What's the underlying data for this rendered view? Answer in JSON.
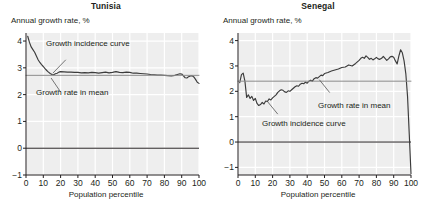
{
  "figure": {
    "background": "#ffffff",
    "panel_background": "#eeeeee",
    "gridline_color": "#ffffff",
    "axis_color": "#231f20",
    "curve_color": "#3b3b3b",
    "mean_line_color": "#8c8c8c"
  },
  "panels": [
    {
      "title": "Tunisia",
      "ylabel": "Annual growth rate, %",
      "xlabel": "Population percentile",
      "annotations": [
        {
          "text": "Growth incidence curve",
          "x": 46,
          "y": 39
        },
        {
          "text": "Growth rate in mean",
          "x": 36,
          "y": 88
        }
      ]
    },
    {
      "title": "Senegal",
      "ylabel": "Annual growth rate, %",
      "xlabel": "Population percentile",
      "annotations": [
        {
          "text": "Growth rate in mean",
          "x": 318,
          "y": 101
        },
        {
          "text": "Growth incidence curve",
          "x": 262,
          "y": 119
        }
      ]
    }
  ],
  "chart_data": [
    {
      "type": "line",
      "title": "Tunisia",
      "xlabel": "Population percentile",
      "ylabel": "Annual growth rate, %",
      "xlim": [
        0,
        100
      ],
      "ylim": [
        -1,
        4.3
      ],
      "xticks": [
        0,
        10,
        20,
        30,
        40,
        50,
        60,
        70,
        80,
        90,
        100
      ],
      "yticks": [
        -1,
        0,
        1,
        2,
        3,
        4
      ],
      "grid": true,
      "legend": "annotations",
      "mean_growth_rate": 2.72,
      "series": [
        {
          "name": "Growth incidence curve",
          "x": [
            1,
            2,
            3,
            4,
            5,
            6,
            7,
            8,
            9,
            10,
            11,
            12,
            13,
            14,
            15,
            16,
            17,
            18,
            19,
            20,
            22,
            24,
            26,
            28,
            30,
            32,
            34,
            36,
            38,
            40,
            42,
            44,
            46,
            48,
            50,
            52,
            54,
            56,
            58,
            60,
            62,
            64,
            66,
            68,
            70,
            72,
            74,
            76,
            78,
            80,
            82,
            84,
            86,
            88,
            89,
            90,
            91,
            92,
            93,
            94,
            95,
            96,
            97,
            98,
            99,
            100
          ],
          "values": [
            4.18,
            3.95,
            3.78,
            3.68,
            3.58,
            3.44,
            3.3,
            3.2,
            3.12,
            3.05,
            2.97,
            2.9,
            2.84,
            2.79,
            2.75,
            2.74,
            2.78,
            2.8,
            2.84,
            2.86,
            2.85,
            2.84,
            2.84,
            2.83,
            2.83,
            2.81,
            2.82,
            2.81,
            2.83,
            2.82,
            2.8,
            2.82,
            2.84,
            2.81,
            2.83,
            2.86,
            2.83,
            2.82,
            2.84,
            2.83,
            2.8,
            2.8,
            2.79,
            2.78,
            2.77,
            2.75,
            2.74,
            2.73,
            2.73,
            2.72,
            2.71,
            2.7,
            2.72,
            2.76,
            2.78,
            2.77,
            2.7,
            2.63,
            2.62,
            2.67,
            2.7,
            2.71,
            2.66,
            2.57,
            2.46,
            2.42
          ]
        },
        {
          "name": "Growth rate in mean",
          "x": [
            0,
            100
          ],
          "values": [
            2.72,
            2.72
          ]
        }
      ]
    },
    {
      "type": "line",
      "title": "Senegal",
      "xlabel": "Population percentile",
      "ylabel": "Annual growth rate, %",
      "xlim": [
        0,
        100
      ],
      "ylim": [
        -1.3,
        4.3
      ],
      "xticks": [
        0,
        10,
        20,
        30,
        40,
        50,
        60,
        70,
        80,
        90,
        100
      ],
      "yticks": [
        -1,
        0,
        1,
        2,
        3,
        4
      ],
      "grid": true,
      "legend": "annotations",
      "mean_growth_rate": 2.4,
      "series": [
        {
          "name": "Growth incidence curve",
          "x": [
            1,
            2,
            3,
            4,
            5,
            6,
            7,
            8,
            9,
            10,
            11,
            12,
            13,
            14,
            15,
            16,
            17,
            18,
            19,
            20,
            21,
            22,
            23,
            24,
            25,
            26,
            27,
            28,
            29,
            30,
            31,
            32,
            33,
            34,
            35,
            36,
            37,
            38,
            39,
            40,
            41,
            42,
            43,
            44,
            45,
            46,
            47,
            48,
            49,
            50,
            52,
            54,
            56,
            58,
            60,
            62,
            64,
            66,
            68,
            70,
            71,
            72,
            73,
            74,
            75,
            76,
            77,
            78,
            79,
            80,
            81,
            82,
            83,
            84,
            85,
            86,
            87,
            88,
            89,
            90,
            91,
            92,
            93,
            94,
            95,
            96,
            97,
            98,
            99,
            100
          ],
          "values": [
            2.34,
            2.66,
            2.72,
            2.4,
            1.76,
            1.86,
            1.72,
            1.8,
            1.64,
            1.72,
            1.52,
            1.44,
            1.48,
            1.56,
            1.5,
            1.62,
            1.6,
            1.7,
            1.66,
            1.74,
            1.8,
            1.86,
            1.96,
            2.02,
            2.06,
            2.04,
            1.98,
            1.96,
            2.02,
            2.0,
            2.06,
            2.12,
            2.18,
            2.22,
            2.2,
            2.28,
            2.32,
            2.3,
            2.36,
            2.32,
            2.4,
            2.44,
            2.4,
            2.5,
            2.54,
            2.52,
            2.58,
            2.64,
            2.62,
            2.7,
            2.74,
            2.8,
            2.84,
            2.88,
            2.94,
            2.96,
            3.04,
            3.0,
            3.1,
            3.22,
            3.3,
            3.34,
            3.3,
            3.4,
            3.34,
            3.26,
            3.3,
            3.24,
            3.28,
            3.34,
            3.28,
            3.26,
            3.3,
            3.38,
            3.3,
            3.22,
            3.28,
            3.36,
            3.38,
            3.34,
            3.2,
            3.08,
            3.4,
            3.64,
            3.52,
            3.2,
            2.7,
            1.8,
            0.3,
            -1.25
          ]
        },
        {
          "name": "Growth rate in mean",
          "x": [
            0,
            100
          ],
          "values": [
            2.4,
            2.4
          ]
        }
      ]
    }
  ]
}
